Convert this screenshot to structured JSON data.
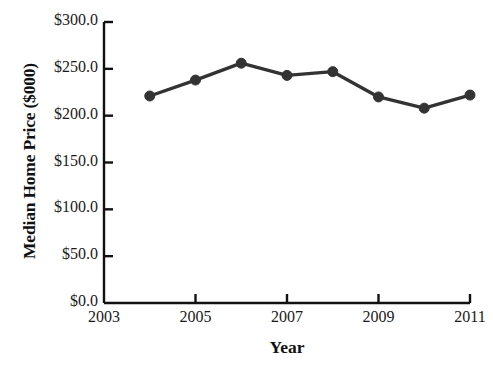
{
  "chart_data": {
    "type": "line",
    "title": "",
    "xlabel": "Year",
    "ylabel": "Median Home Price ($000)",
    "x": [
      2004,
      2005,
      2006,
      2007,
      2008,
      2009,
      2010,
      2011
    ],
    "values": [
      221,
      238,
      256,
      243,
      247,
      220,
      208,
      222
    ],
    "series": [
      {
        "name": "Median Home Price",
        "values": [
          221,
          238,
          256,
          243,
          247,
          220,
          208,
          222
        ],
        "color": "#333333",
        "marker": "circle"
      }
    ],
    "xlim": [
      2003,
      2011
    ],
    "ylim": [
      0,
      300
    ],
    "x_tick_values": [
      2003,
      2005,
      2007,
      2009,
      2011
    ],
    "x_tick_labels": [
      "2003",
      "2005",
      "2007",
      "2009",
      "2011"
    ],
    "y_tick_values": [
      0,
      50,
      100,
      150,
      200,
      250,
      300
    ],
    "y_tick_labels": [
      "$0.0",
      "$50.0",
      "$100.0",
      "$150.0",
      "$200.0",
      "$250.0",
      "$300.0"
    ],
    "grid": false,
    "legend": "none",
    "axis_color": "#111111",
    "background_color": "#ffffff"
  },
  "axes": {
    "y_title": "Median Home Price ($000)",
    "x_title": "Year"
  }
}
